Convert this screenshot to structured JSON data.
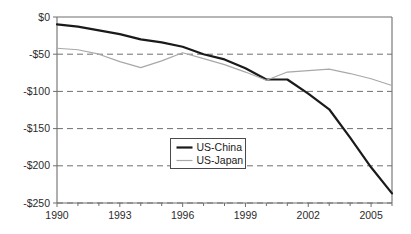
{
  "chart_data": {
    "type": "line",
    "title": "",
    "subtitle": "",
    "xlabel": "",
    "ylabel": "",
    "xlim": [
      1990,
      2006
    ],
    "ylim": [
      -250,
      0
    ],
    "grid": true,
    "grid_axis": "y",
    "legend_position": "center",
    "x": [
      1990,
      1991,
      1992,
      1993,
      1994,
      1995,
      1996,
      1997,
      1998,
      1999,
      2000,
      2001,
      2002,
      2003,
      2004,
      2005,
      2006
    ],
    "y_ticks": [
      0,
      -50,
      -100,
      -150,
      -200,
      -250
    ],
    "y_tick_labels": [
      "$0",
      "-$50",
      "-$100",
      "-$150",
      "-$200",
      "-$250"
    ],
    "x_ticks": [
      1990,
      1991,
      1992,
      1993,
      1994,
      1995,
      1996,
      1997,
      1998,
      1999,
      2000,
      2001,
      2002,
      2003,
      2004,
      2005,
      2006
    ],
    "x_tick_labels": [
      "1990",
      "",
      "",
      "1993",
      "",
      "",
      "1996",
      "",
      "",
      "1999",
      "",
      "",
      "2002",
      "",
      "",
      "2005",
      ""
    ],
    "x_major_ticks": [
      1990,
      1993,
      1996,
      1999,
      2002,
      2005
    ],
    "series": [
      {
        "name": "US-China",
        "color": "#1a1a1a",
        "width": 2.2,
        "values": [
          -10,
          -13,
          -18,
          -23,
          -30,
          -34,
          -40,
          -50,
          -57,
          -69,
          -84,
          -84,
          -103,
          -124,
          -162,
          -202,
          -237
        ]
      },
      {
        "name": "US-Japan",
        "color": "#a8a8a8",
        "width": 1.2,
        "values": [
          -42,
          -44,
          -50,
          -60,
          -68,
          -59,
          -48,
          -56,
          -64,
          -74,
          -85,
          -74,
          -72,
          -70,
          -76,
          -83,
          -92
        ]
      }
    ]
  },
  "legend": {
    "entries": [
      {
        "label": "US-China",
        "color": "#1a1a1a",
        "width": 2.2
      },
      {
        "label": "US-Japan",
        "color": "#a8a8a8",
        "width": 1.2
      }
    ]
  },
  "colors": {
    "background": "#ffffff",
    "axis": "#6e6e6e",
    "grid": "#707070",
    "text": "#2b2b2b",
    "us_china": "#1a1a1a",
    "us_japan": "#a8a8a8"
  }
}
